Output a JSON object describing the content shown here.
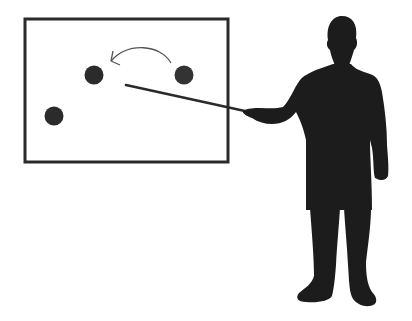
{
  "scene": {
    "description": "Silhouette of a presenter pointing a stick at a board with three dots and a curved arrow",
    "colors": {
      "background": "#ffffff",
      "board_frame": "#2a2a2a",
      "dot": "#2b2b2b",
      "arrow": "#555555",
      "pointer": "#2a2a2a",
      "silhouette": "#1c1c1c"
    },
    "board": {
      "x": 25,
      "y": 19,
      "width": 203,
      "height": 143,
      "stroke_width": 3
    },
    "dots": [
      {
        "name": "dot-middle",
        "cx": 94,
        "cy": 75,
        "r": 9.5
      },
      {
        "name": "dot-right",
        "cx": 184,
        "cy": 75,
        "r": 9.5
      },
      {
        "name": "dot-bottom-left",
        "cx": 54,
        "cy": 116,
        "r": 9.5
      }
    ],
    "arrow": {
      "from": [
        170,
        63
      ],
      "to": [
        112,
        62
      ],
      "direction": "right-to-left"
    },
    "pointer": {
      "from": [
        126,
        85
      ],
      "to": [
        252,
        113
      ]
    }
  }
}
